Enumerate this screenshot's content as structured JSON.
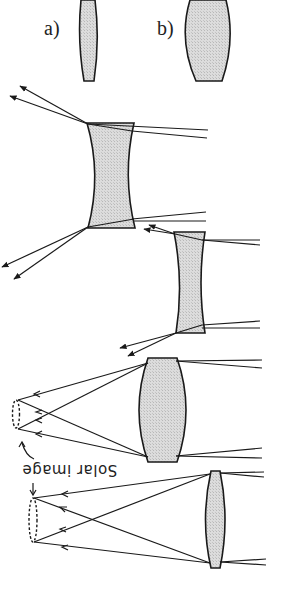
{
  "figure": {
    "labels": {
      "a": "a)",
      "b": "b)"
    },
    "annotations": {
      "solar_image_1": "Solar image",
      "solar_image_2": "Solar image"
    },
    "colors": {
      "lens_fill": "#d4d4d4",
      "stroke": "#1a1a1a",
      "background": "#ffffff"
    },
    "elements": [
      {
        "type": "thin-lens-profile",
        "label": "a"
      },
      {
        "type": "thick-lens-profile",
        "label": "b"
      },
      {
        "type": "concave-lens-diverging-rays",
        "size": "large"
      },
      {
        "type": "concave-lens-diverging-rays",
        "size": "small"
      },
      {
        "type": "convex-lens-focusing-rays",
        "size": "thick"
      },
      {
        "type": "convex-lens-focusing-rays",
        "size": "thin"
      }
    ]
  }
}
